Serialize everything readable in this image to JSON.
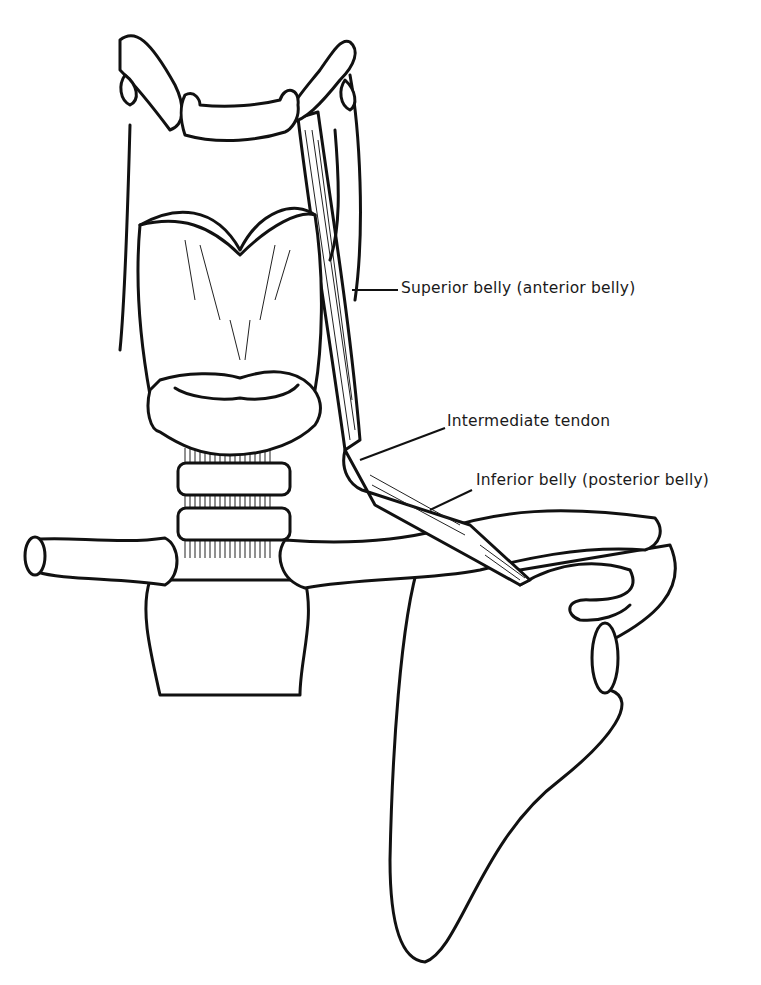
{
  "diagram": {
    "labels": [
      {
        "id": "superior-belly",
        "text": "Superior belly (anterior belly)"
      },
      {
        "id": "intermediate-tendon",
        "text": "Intermediate tendon"
      },
      {
        "id": "inferior-belly",
        "text": "Inferior belly (posterior belly)"
      }
    ],
    "structures": [
      "hyoid bone",
      "thyroid cartilage",
      "cricoid cartilage",
      "trachea",
      "clavicle",
      "sternum",
      "scapula",
      "omohyoid muscle"
    ],
    "colors": {
      "line": "#111111",
      "background": "#ffffff"
    }
  }
}
